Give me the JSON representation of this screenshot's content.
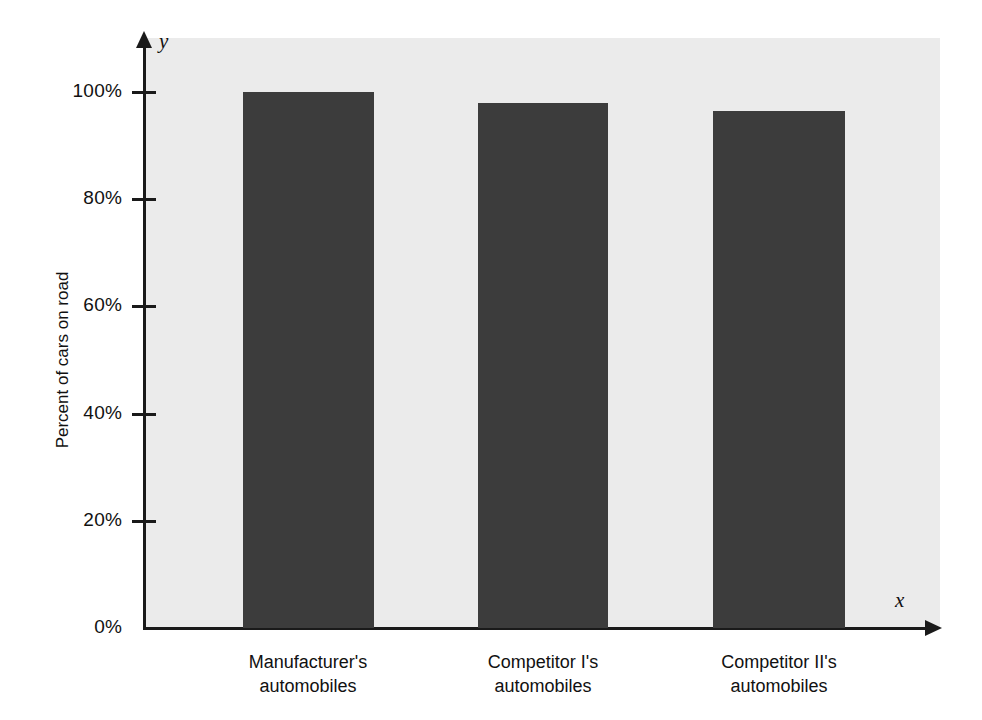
{
  "chart_data": {
    "type": "bar",
    "title": "",
    "xlabel": "x",
    "ylabel": "Percent of cars on road",
    "y_axis_variable": "y",
    "x_axis_variable": "x",
    "categories": [
      "Manufacturer's automobiles",
      "Competitor I's automobiles",
      "Competitor II's automobiles"
    ],
    "category_lines": [
      [
        "Manufacturer's",
        "automobiles"
      ],
      [
        "Competitor I's",
        "automobiles"
      ],
      [
        "Competitor II's",
        "automobiles"
      ]
    ],
    "values": [
      100,
      98,
      96.5
    ],
    "value_labels": [
      "100%",
      "98%",
      "96.5%"
    ],
    "ylim": [
      0,
      110
    ],
    "ytick_values": [
      0,
      20,
      40,
      60,
      80,
      100
    ],
    "ytick_labels": [
      "0%",
      "20%",
      "40%",
      "60%",
      "80%",
      "100%"
    ],
    "grid": false,
    "legend": null,
    "bar_color": "#3c3c3c",
    "plot_background_color": "#ebebeb",
    "axis_color": "#1a1a1a",
    "figure_background_color": "#ffffff"
  }
}
